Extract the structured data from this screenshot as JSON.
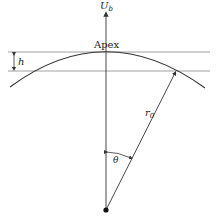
{
  "diagram": {
    "labels": {
      "velocity": "U",
      "velocity_sub": "b",
      "apex": "Apex",
      "height": "h",
      "radius": "r",
      "radius_sub": "0",
      "angle": "θ"
    },
    "colors": {
      "line": "#333333",
      "guide": "#888888",
      "text": "#222222"
    },
    "geometry": {
      "center": [
        106,
        210
      ],
      "apex": [
        106,
        52
      ],
      "lower_line_y": 71,
      "radius_endpoint": [
        176,
        71
      ]
    }
  }
}
